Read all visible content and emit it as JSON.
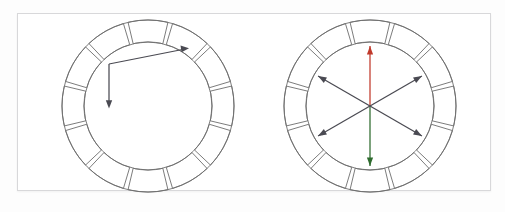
{
  "figure": {
    "background_color": "#fdfdfd",
    "frame_border_color": "#d8d8da",
    "panel_background": "#ffffff"
  },
  "palette": {
    "outline": "#6d6d6d",
    "arrow_grey": "#4a4a52",
    "arrow_red": "#c0392b",
    "arrow_green": "#2d6b2d",
    "orange": "#ee8f33",
    "orange_light": "#f0933c",
    "yellow": "#e5e055",
    "yellow_green": "#e8e253",
    "green_mid": "#5f9e45",
    "green_dark": "#3a7a37",
    "red_orange": "#c63e22",
    "blue_dark": "#2e3070",
    "purple": "#5e3060",
    "empty_segment": "#ffffff"
  },
  "wheels": [
    {
      "id": "left-wheel",
      "name": "analogous-color-wheel",
      "label": "Analogous scheme",
      "segment_count": 12,
      "colored_segment_indices": [
        2,
        3,
        4
      ],
      "segments": [
        {
          "index": 0,
          "position": "12 o'clock",
          "color": "#ffffff",
          "filled": false
        },
        {
          "index": 1,
          "position": "1 o'clock",
          "color": "#ffffff",
          "filled": false
        },
        {
          "index": 2,
          "position": "2 o'clock",
          "color": "#f0933c",
          "filled": true,
          "name": "orange"
        },
        {
          "index": 3,
          "position": "3 o'clock",
          "color": "#e8e253",
          "filled": true,
          "name": "yellow"
        },
        {
          "index": 4,
          "position": "4 o'clock",
          "color": "#5f9e45",
          "filled": true,
          "name": "green"
        },
        {
          "index": 5,
          "position": "5 o'clock",
          "color": "#ffffff",
          "filled": false
        },
        {
          "index": 6,
          "position": "6 o'clock",
          "color": "#ffffff",
          "filled": false
        },
        {
          "index": 7,
          "position": "7 o'clock",
          "color": "#ffffff",
          "filled": false
        },
        {
          "index": 8,
          "position": "8 o'clock",
          "color": "#ffffff",
          "filled": false
        },
        {
          "index": 9,
          "position": "9 o'clock",
          "color": "#ffffff",
          "filled": false
        },
        {
          "index": 10,
          "position": "10 o'clock",
          "color": "#ffffff",
          "filled": false
        },
        {
          "index": 11,
          "position": "11 o'clock",
          "color": "#ffffff",
          "filled": false
        }
      ],
      "arrows": [
        {
          "name": "arrow-to-orange",
          "from": "vertex",
          "to_segment": 2,
          "color": "#4a4a52",
          "double_headed": false
        },
        {
          "name": "arrow-to-green",
          "from": "vertex",
          "to_segment": 4,
          "color": "#4a4a52",
          "double_headed": false
        }
      ],
      "arrow_style": "two single-headed arrows from a shared bent vertex"
    },
    {
      "id": "right-wheel",
      "name": "triadic-complementary-color-wheel",
      "label": "Complementary / triadic scheme",
      "segment_count": 12,
      "colored_segment_indices": [
        0,
        2,
        4,
        6,
        8,
        10
      ],
      "segments": [
        {
          "index": 0,
          "position": "12 o'clock",
          "color": "#c63e22",
          "filled": true,
          "name": "red-orange"
        },
        {
          "index": 1,
          "position": "1 o'clock",
          "color": "#ffffff",
          "filled": false
        },
        {
          "index": 2,
          "position": "2 o'clock",
          "color": "#ee8f33",
          "filled": true,
          "name": "orange"
        },
        {
          "index": 3,
          "position": "3 o'clock",
          "color": "#ffffff",
          "filled": false
        },
        {
          "index": 4,
          "position": "4 o'clock",
          "color": "#e5e055",
          "filled": true,
          "name": "yellow"
        },
        {
          "index": 5,
          "position": "5 o'clock",
          "color": "#ffffff",
          "filled": false
        },
        {
          "index": 6,
          "position": "6 o'clock",
          "color": "#3a7a37",
          "filled": true,
          "name": "green"
        },
        {
          "index": 7,
          "position": "7 o'clock",
          "color": "#ffffff",
          "filled": false
        },
        {
          "index": 8,
          "position": "8 o'clock",
          "color": "#2e3070",
          "filled": true,
          "name": "blue"
        },
        {
          "index": 9,
          "position": "9 o'clock",
          "color": "#ffffff",
          "filled": false
        },
        {
          "index": 10,
          "position": "10 o'clock",
          "color": "#5e3060",
          "filled": true,
          "name": "purple"
        },
        {
          "index": 11,
          "position": "11 o'clock",
          "color": "#ffffff",
          "filled": false
        }
      ],
      "arrows": [
        {
          "name": "arrow-vertical",
          "angle_deg": 90,
          "color_up": "#c0392b",
          "color_down": "#2d6b2d",
          "double_headed": true
        },
        {
          "name": "arrow-diagonal-ne-sw",
          "angle_deg": 30,
          "color": "#4a4a52",
          "double_headed": true
        },
        {
          "name": "arrow-diagonal-nw-se",
          "angle_deg": 150,
          "color": "#4a4a52",
          "double_headed": true
        }
      ],
      "arrow_style": "three double-headed axes crossing at the hub, 60 degrees apart"
    }
  ]
}
